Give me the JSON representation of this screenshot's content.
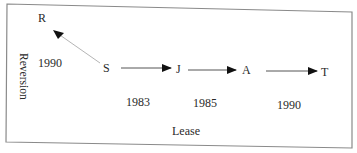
{
  "diagram": {
    "axis_labels": {
      "vertical": "Reversion",
      "horizontal": "Lease"
    },
    "nodes": [
      {
        "id": "R",
        "label": "R"
      },
      {
        "id": "S",
        "label": "S"
      },
      {
        "id": "J",
        "label": "J"
      },
      {
        "id": "A",
        "label": "A"
      },
      {
        "id": "T",
        "label": "T"
      }
    ],
    "edges": [
      {
        "from": "S",
        "to": "R",
        "year": "1990",
        "type": "reversion"
      },
      {
        "from": "S",
        "to": "J",
        "year": "1983",
        "type": "lease"
      },
      {
        "from": "J",
        "to": "A",
        "year": "1985",
        "type": "lease"
      },
      {
        "from": "A",
        "to": "T",
        "year": "1990",
        "type": "lease"
      }
    ],
    "colors": {
      "border": "#8a8a8a",
      "arrow": "#111111",
      "diagonal_arrow": "#b0b0b0",
      "text": "#2a2a2a"
    }
  }
}
